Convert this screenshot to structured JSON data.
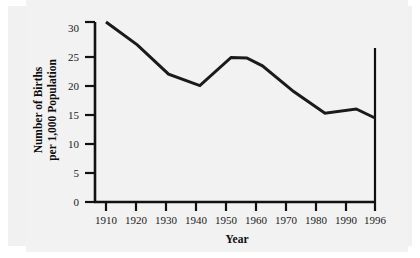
{
  "figure": {
    "background_color": "#f2f2f2",
    "page_color": "#ffffff",
    "line_color": "#1a1a1a",
    "axis_color": "#111111"
  },
  "axis": {
    "x_title": "Year",
    "y_title_line1": "Number of Births",
    "y_title_line2": "per 1,000 Population",
    "y_ticks": [
      "0",
      "5",
      "10",
      "15",
      "20",
      "25",
      "30"
    ],
    "x_ticks": [
      "1910",
      "1920",
      "1930",
      "1940",
      "1950",
      "1960",
      "1970",
      "1980",
      "1990",
      "1996"
    ]
  },
  "chart_data": {
    "type": "line",
    "title": "",
    "subtitle": "",
    "xlabel": "Year",
    "ylabel": "Number of Births per 1,000 Population",
    "x": [
      1910,
      1920,
      1930,
      1940,
      1950,
      1955,
      1960,
      1970,
      1980,
      1990,
      1996
    ],
    "values": [
      30.0,
      26.2,
      21.3,
      19.4,
      24.1,
      24.0,
      22.7,
      18.4,
      14.8,
      15.5,
      14.0
    ],
    "xlim": [
      1910,
      1996
    ],
    "ylim": [
      0,
      30
    ],
    "xtick_labels": [
      "1910",
      "1920",
      "1930",
      "1940",
      "1950",
      "1960",
      "1970",
      "1980",
      "1990",
      "1996"
    ],
    "ytick_values": [
      0,
      5,
      10,
      15,
      20,
      25,
      30
    ],
    "grid": false,
    "legend": "none",
    "series": [
      {
        "name": "Birth rate",
        "values": [
          30.0,
          26.2,
          21.3,
          19.4,
          24.1,
          24.0,
          22.7,
          18.4,
          14.8,
          15.5,
          14.0
        ]
      }
    ],
    "annotations": []
  }
}
